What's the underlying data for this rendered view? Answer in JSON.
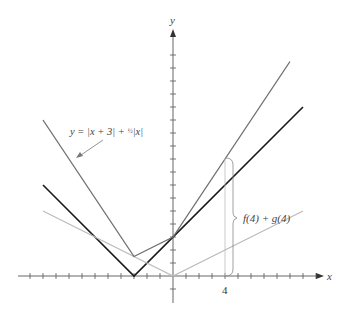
{
  "chart_data": {
    "type": "line",
    "title": "",
    "xlabel": "x",
    "ylabel": "y",
    "xlim": [
      -12,
      12
    ],
    "ylim": [
      -2,
      20
    ],
    "grid": false,
    "series": [
      {
        "name": "y = |x + 3|",
        "color": "#1a1a1a",
        "x": [
          -10,
          -3,
          10
        ],
        "y": [
          7,
          0,
          13
        ]
      },
      {
        "name": "y = 1/2 |x|",
        "color": "#bdbdbd",
        "x": [
          -10,
          0,
          10
        ],
        "y": [
          5,
          0,
          5
        ]
      },
      {
        "name": "y = |x + 3| + 1/2 |x|",
        "color": "#6e6e6e",
        "x": [
          -10,
          -3,
          0,
          9
        ],
        "y": [
          12,
          1.5,
          3,
          16.5
        ]
      }
    ],
    "annotations": [
      {
        "text": "y = |x + 3| + ½|x|",
        "points_to": "y = |x + 3| + 1/2 |x|"
      },
      {
        "text": "f(4) + g(4)",
        "x": 4,
        "y_from": 0,
        "y_to": 9,
        "type": "brace"
      }
    ],
    "x_tick_labels": [
      "4"
    ]
  },
  "labels": {
    "x_axis": "x",
    "y_axis": "y",
    "tick_4": "4",
    "curve_label_prefix": "y = ",
    "curve_label_abs1": "x + 3",
    "curve_label_plus": " + ",
    "curve_label_abs2": "x",
    "brace_label": "f(4) + g(4)"
  },
  "colors": {
    "f": "#1a1a1a",
    "g": "#bdbdbd",
    "sum": "#6e6e6e",
    "axis": "#555555"
  }
}
